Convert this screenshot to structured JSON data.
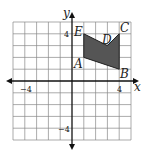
{
  "diagram": {
    "type": "coordinate-plane-polygon",
    "axes": {
      "x_label": "x",
      "y_label": "y",
      "x_range": [
        -5,
        5
      ],
      "y_range": [
        -5,
        5
      ],
      "tick_labels": {
        "x_neg": "−4",
        "x_pos": "4",
        "y_pos": "4",
        "y_neg": "−4"
      },
      "grid": true
    },
    "polygon": {
      "fill": "#555555",
      "vertices": [
        {
          "name": "A",
          "x": 1,
          "y": 2
        },
        {
          "name": "B",
          "x": 4,
          "y": 1
        },
        {
          "name": "C",
          "x": 4,
          "y": 4
        },
        {
          "name": "D",
          "x": 3,
          "y": 3
        },
        {
          "name": "E",
          "x": 1,
          "y": 4
        }
      ]
    },
    "labels": {
      "A": "A",
      "B": "B",
      "C": "C",
      "D": "D",
      "E": "E"
    }
  }
}
